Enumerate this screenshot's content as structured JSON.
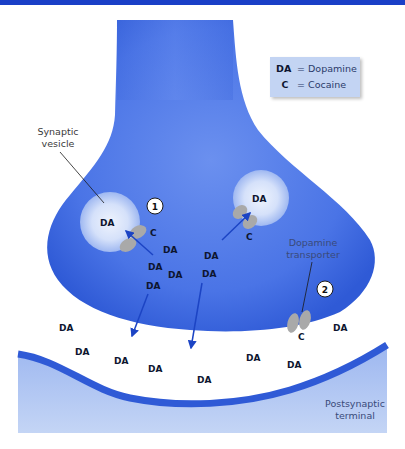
{
  "figure": {
    "colors": {
      "top_bar": "#1a3fc7",
      "presynaptic": "#3f6be0",
      "presynaptic_light": "#6a8ff0",
      "vesicle": "#dbe6fb",
      "postsynaptic_fill": "#b9cdf3",
      "postsynaptic_membrane": "#2f5ad6",
      "legend_bg": "#c3d4f3",
      "arrow": "#1c44c4",
      "transporter": "#a9a9a9"
    }
  },
  "legend": {
    "items": [
      {
        "key": "DA",
        "label": "= Dopamine"
      },
      {
        "key": "C",
        "label": "= Cocaine"
      }
    ]
  },
  "labels": {
    "synaptic_vesicle_line1": "Synaptic",
    "synaptic_vesicle_line2": "vesicle",
    "dopamine_transporter_line1": "Dopamine",
    "dopamine_transporter_line2": "transporter",
    "postsynaptic_line1": "Postsynaptic",
    "postsynaptic_line2": "terminal"
  },
  "markers": {
    "step1": "1",
    "step2": "2"
  },
  "molecules": {
    "da": "DA",
    "c": "C"
  }
}
